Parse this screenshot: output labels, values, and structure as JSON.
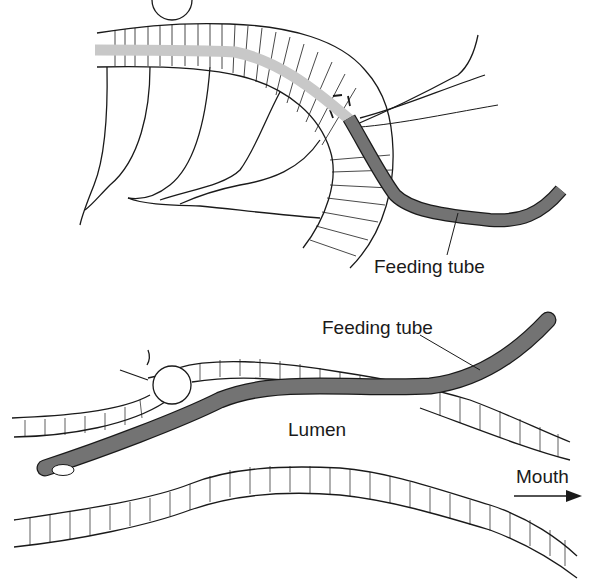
{
  "figure": {
    "panels": [
      {
        "id": "top",
        "description": "Feeding tube passed through bowel wall (mesenteric side) with suture",
        "labels": {
          "tube": "Feeding tube"
        }
      },
      {
        "id": "bottom",
        "description": "Longitudinal section showing feeding tube in lumen with purse-string suture",
        "labels": {
          "tube": "Feeding tube",
          "lumen": "Lumen",
          "direction": "Mouth"
        }
      }
    ],
    "colors": {
      "tube": "#707070",
      "tube_inside_wall": "#c8c8c8",
      "line": "#1a1a1a",
      "background": "#ffffff"
    }
  }
}
